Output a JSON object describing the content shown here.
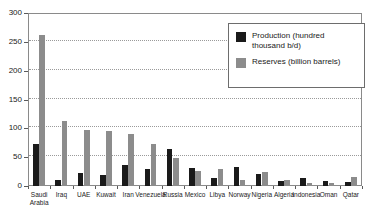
{
  "chart_data": {
    "type": "bar",
    "title": "",
    "subtitle": "",
    "xlabel": "",
    "ylabel": "",
    "ylim": [
      0,
      300
    ],
    "ytick_labels": [
      "0",
      "50",
      "100",
      "150",
      "200",
      "250",
      "300"
    ],
    "ytick_values": [
      0,
      50,
      100,
      150,
      200,
      250,
      300
    ],
    "grid": true,
    "legend_position": "top-right",
    "categories": [
      "Saudi Arabia",
      "Iraq",
      "UAE",
      "Kuwait",
      "Iran",
      "Venezuela",
      "Russia",
      "Mexico",
      "Libya",
      "Norway",
      "Nigeria",
      "Algeria",
      "Indonesia",
      "Oman",
      "Qatar"
    ],
    "series": [
      {
        "name": "Production (hundred thousand b/d)",
        "color": "#1a1a1a",
        "values": [
          72,
          11,
          22,
          19,
          36,
          30,
          65,
          32,
          14,
          33,
          21,
          8,
          14,
          9,
          7
        ]
      },
      {
        "name": "Reserves (billion barrels)",
        "color": "#8c8c8c",
        "values": [
          262,
          112,
          98,
          96,
          90,
          72,
          49,
          26,
          30,
          10,
          24,
          11,
          5,
          5,
          15
        ]
      }
    ]
  },
  "legend": {
    "items": [
      {
        "label": "Production (hundred thousand b/d)",
        "swatch": "production"
      },
      {
        "label": "Reserves (billion barrels)",
        "swatch": "reserves"
      }
    ]
  }
}
